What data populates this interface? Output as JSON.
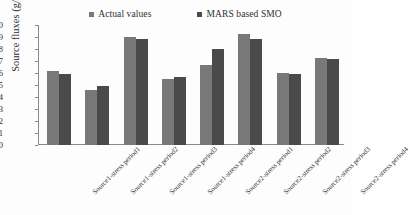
{
  "chart_data": {
    "type": "bar",
    "title": "",
    "xlabel": "",
    "ylabel": "Source fluxes (g/sec)",
    "ylim": [
      0,
      10
    ],
    "yticks": [
      0,
      1,
      2,
      3,
      4,
      5,
      6,
      7,
      8,
      9,
      10
    ],
    "grid": false,
    "legend_position": "top",
    "categories": [
      "Source1-stress period1",
      "Source1-stress period2",
      "Source1-stress period3",
      "Source1-stress period4",
      "Source2-stress period1",
      "Source2-stress period2",
      "Source2-stress period3",
      "Source2-stress period4"
    ],
    "series": [
      {
        "name": "Actual values",
        "color": "#787878",
        "values": [
          6.2,
          4.6,
          9.0,
          5.5,
          6.65,
          9.25,
          6.0,
          7.25
        ]
      },
      {
        "name": "MARS based SMO",
        "color": "#4a4a4a",
        "values": [
          5.95,
          4.9,
          8.8,
          5.65,
          8.0,
          8.85,
          5.9,
          7.2
        ]
      }
    ]
  },
  "legend": {
    "entries": [
      {
        "label": "Actual values",
        "color": "#787878"
      },
      {
        "label": "MARS based SMO",
        "color": "#4a4a4a"
      }
    ]
  },
  "axes": {
    "y_title": "Source fluxes (g/sec)",
    "y_tick_labels": [
      "10",
      "9",
      "8",
      "7",
      "6",
      "5",
      "4",
      "3",
      "2",
      "1",
      "0"
    ]
  },
  "colors": {
    "series_actual": "#787878",
    "series_mars": "#4a4a4a",
    "axis": "#8a8a8a",
    "text": "#303030",
    "background": "#fdfdfd"
  }
}
